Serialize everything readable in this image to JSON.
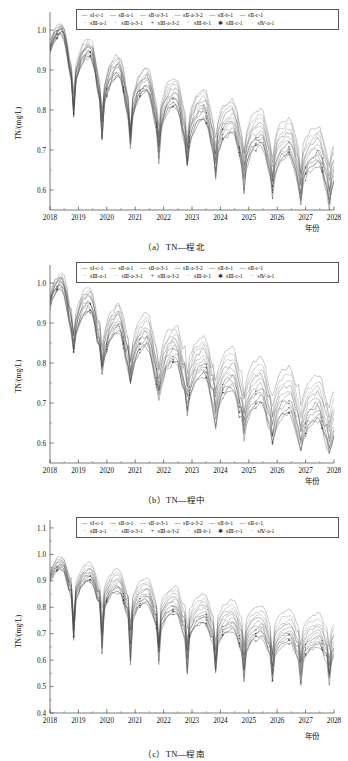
{
  "figure": {
    "title_implicit": "TN 浓度预测曲线",
    "axis_x_label": "年份",
    "axis_y_label": "TN/(mg/L)",
    "line_color": "#4a4a4a"
  },
  "legend": {
    "row1": [
      {
        "mark": "—",
        "label": "sⅠ-c-1"
      },
      {
        "mark": "",
        "label": "sⅡ-a-1"
      },
      {
        "mark": "",
        "label": "sⅡ-a-3-1"
      },
      {
        "mark": "",
        "label": "sⅡ-a-3-2"
      },
      {
        "mark": "",
        "label": "sⅡ-b-1"
      },
      {
        "mark": "",
        "label": "sⅡ-c-1"
      }
    ],
    "row2": [
      {
        "mark": "·",
        "label": "sⅢ-a-1"
      },
      {
        "mark": "·",
        "label": "sⅢ-a-3-1"
      },
      {
        "mark": "+",
        "label": "sⅢ-a-3-2"
      },
      {
        "mark": "·",
        "label": "sⅢ-b-1"
      },
      {
        "mark": "✱",
        "label": "sⅢ-c-1"
      },
      {
        "mark": "·",
        "label": "sⅣ-a-1"
      }
    ]
  },
  "panels": [
    {
      "id": "a",
      "caption": "（a）TN—程北",
      "y_ticks": [
        "1.0",
        "0.9",
        "0.8",
        "0.7",
        "0.6"
      ],
      "y_min": 0.55,
      "y_max": 1.045,
      "x_ticks": [
        "2018",
        "2019",
        "2020",
        "2021",
        "2022",
        "2023",
        "2024",
        "2025",
        "2026",
        "2027",
        "2028"
      ]
    },
    {
      "id": "b",
      "caption": "（b）TN—程中",
      "y_ticks": [
        "1.0",
        "0.9",
        "0.8",
        "0.7",
        "0.6"
      ],
      "y_min": 0.55,
      "y_max": 1.045,
      "x_ticks": [
        "2018",
        "2019",
        "2020",
        "2021",
        "2022",
        "2023",
        "2024",
        "2025",
        "2026",
        "2027",
        "2028"
      ]
    },
    {
      "id": "c",
      "caption": "（c）TN—程南",
      "y_ticks": [
        "1.1",
        "1.0",
        "0.9",
        "0.8",
        "0.7",
        "0.6",
        "0.5",
        "0.4"
      ],
      "y_min": 0.4,
      "y_max": 1.13,
      "x_ticks": [
        "2018",
        "2019",
        "2020",
        "2021",
        "2022",
        "2023",
        "2024",
        "2025",
        "2026",
        "2027",
        "2028"
      ]
    }
  ],
  "chart_data": {
    "type": "line",
    "xlabel": "年份",
    "ylabel": "TN/(mg/L)",
    "grid": false,
    "legend_position": "top-center-inside",
    "x": [
      2018,
      2019,
      2020,
      2021,
      2022,
      2023,
      2024,
      2025,
      2026,
      2027,
      2028
    ],
    "subplots": [
      {
        "id": "a",
        "caption": "（a）TN—程北",
        "ylim": [
          0.55,
          1.045
        ],
        "yticks": [
          0.6,
          0.7,
          0.8,
          0.9,
          1.0
        ],
        "xlim": [
          2018,
          2028
        ],
        "series": [
          {
            "name": "sⅠ-c-1",
            "values": [
              0.99,
              0.95,
              0.905,
              0.875,
              0.855,
              0.825,
              0.805,
              0.775,
              0.755,
              0.735,
              0.725
            ]
          },
          {
            "name": "sⅡ-a-1",
            "values": [
              0.985,
              0.945,
              0.9,
              0.87,
              0.845,
              0.815,
              0.795,
              0.765,
              0.745,
              0.722,
              0.712
            ]
          },
          {
            "name": "sⅡ-a-3-1",
            "values": [
              0.98,
              0.94,
              0.895,
              0.862,
              0.838,
              0.806,
              0.785,
              0.755,
              0.734,
              0.712,
              0.7
            ]
          },
          {
            "name": "sⅡ-a-3-2",
            "values": [
              0.978,
              0.936,
              0.89,
              0.856,
              0.83,
              0.798,
              0.776,
              0.746,
              0.724,
              0.702,
              0.69
            ]
          },
          {
            "name": "sⅡ-b-1",
            "values": [
              0.975,
              0.932,
              0.884,
              0.85,
              0.822,
              0.79,
              0.768,
              0.736,
              0.714,
              0.692,
              0.678
            ]
          },
          {
            "name": "sⅡ-c-1",
            "values": [
              0.972,
              0.928,
              0.878,
              0.844,
              0.815,
              0.782,
              0.758,
              0.726,
              0.704,
              0.68,
              0.668
            ]
          },
          {
            "name": "sⅢ-a-1",
            "values": [
              0.97,
              0.924,
              0.872,
              0.838,
              0.808,
              0.774,
              0.75,
              0.716,
              0.694,
              0.67,
              0.658
            ]
          },
          {
            "name": "sⅢ-a-3-1",
            "values": [
              0.968,
              0.92,
              0.868,
              0.832,
              0.802,
              0.766,
              0.742,
              0.708,
              0.685,
              0.66,
              0.648
            ]
          },
          {
            "name": "sⅢ-a-3-2",
            "values": [
              0.966,
              0.916,
              0.863,
              0.827,
              0.796,
              0.76,
              0.735,
              0.7,
              0.677,
              0.652,
              0.64
            ]
          },
          {
            "name": "sⅢ-c-1",
            "values": [
              0.964,
              0.913,
              0.859,
              0.822,
              0.79,
              0.754,
              0.728,
              0.693,
              0.67,
              0.645,
              0.632
            ]
          },
          {
            "name": "sⅣ-a-1",
            "values": [
              0.962,
              0.91,
              0.855,
              0.818,
              0.786,
              0.748,
              0.722,
              0.687,
              0.663,
              0.638,
              0.626
            ]
          }
        ]
      },
      {
        "id": "b",
        "caption": "（b）TN—程中",
        "ylim": [
          0.55,
          1.045
        ],
        "yticks": [
          0.6,
          0.7,
          0.8,
          0.9,
          1.0
        ],
        "xlim": [
          2018,
          2028
        ],
        "series": [
          {
            "name": "sⅠ-c-1",
            "values": [
              0.99,
              0.965,
              0.915,
              0.895,
              0.865,
              0.845,
              0.815,
              0.788,
              0.768,
              0.748,
              0.735
            ]
          },
          {
            "name": "sⅡ-a-1",
            "values": [
              0.985,
              0.958,
              0.905,
              0.884,
              0.852,
              0.83,
              0.8,
              0.772,
              0.75,
              0.73,
              0.716
            ]
          },
          {
            "name": "sⅡ-a-3-1",
            "values": [
              0.982,
              0.952,
              0.898,
              0.875,
              0.842,
              0.818,
              0.788,
              0.758,
              0.736,
              0.715,
              0.702
            ]
          },
          {
            "name": "sⅡ-a-3-2",
            "values": [
              0.979,
              0.946,
              0.891,
              0.866,
              0.833,
              0.807,
              0.777,
              0.746,
              0.723,
              0.702,
              0.69
            ]
          },
          {
            "name": "sⅡ-b-1",
            "values": [
              0.976,
              0.94,
              0.884,
              0.858,
              0.824,
              0.797,
              0.766,
              0.734,
              0.711,
              0.69,
              0.678
            ]
          },
          {
            "name": "sⅡ-c-1",
            "values": [
              0.973,
              0.934,
              0.877,
              0.85,
              0.815,
              0.787,
              0.755,
              0.723,
              0.7,
              0.678,
              0.666
            ]
          },
          {
            "name": "sⅢ-a-1",
            "values": [
              0.97,
              0.928,
              0.87,
              0.842,
              0.806,
              0.777,
              0.745,
              0.712,
              0.689,
              0.667,
              0.655
            ]
          },
          {
            "name": "sⅢ-a-3-1",
            "values": [
              0.967,
              0.922,
              0.864,
              0.835,
              0.798,
              0.768,
              0.735,
              0.702,
              0.679,
              0.656,
              0.645
            ]
          },
          {
            "name": "sⅢ-a-3-2",
            "values": [
              0.964,
              0.917,
              0.858,
              0.828,
              0.79,
              0.759,
              0.726,
              0.693,
              0.669,
              0.646,
              0.636
            ]
          },
          {
            "name": "sⅢ-c-1",
            "values": [
              0.961,
              0.912,
              0.853,
              0.822,
              0.783,
              0.751,
              0.718,
              0.684,
              0.66,
              0.637,
              0.628
            ]
          },
          {
            "name": "sⅣ-a-1",
            "values": [
              0.958,
              0.907,
              0.848,
              0.816,
              0.776,
              0.744,
              0.71,
              0.676,
              0.652,
              0.629,
              0.62
            ]
          }
        ]
      },
      {
        "id": "c",
        "caption": "（c）TN—程南",
        "ylim": [
          0.4,
          1.13
        ],
        "yticks": [
          0.4,
          0.5,
          0.6,
          0.7,
          0.8,
          0.9,
          1.0,
          1.1
        ],
        "xlim": [
          2018,
          2028
        ],
        "series": [
          {
            "name": "sⅠ-c-1",
            "values": [
              0.955,
              0.935,
              0.915,
              0.88,
              0.852,
              0.822,
              0.8,
              0.782,
              0.766,
              0.752,
              0.748
            ]
          },
          {
            "name": "sⅡ-a-1",
            "values": [
              0.95,
              0.925,
              0.902,
              0.866,
              0.838,
              0.806,
              0.783,
              0.763,
              0.745,
              0.73,
              0.726
            ]
          },
          {
            "name": "sⅡ-a-3-1",
            "values": [
              0.946,
              0.917,
              0.892,
              0.855,
              0.826,
              0.793,
              0.769,
              0.748,
              0.729,
              0.714,
              0.71
            ]
          },
          {
            "name": "sⅡ-a-3-2",
            "values": [
              0.942,
              0.91,
              0.883,
              0.845,
              0.815,
              0.781,
              0.757,
              0.735,
              0.716,
              0.7,
              0.696
            ]
          },
          {
            "name": "sⅡ-b-1",
            "values": [
              0.938,
              0.903,
              0.874,
              0.836,
              0.805,
              0.77,
              0.745,
              0.723,
              0.703,
              0.687,
              0.684
            ]
          },
          {
            "name": "sⅡ-c-1",
            "values": [
              0.934,
              0.897,
              0.866,
              0.827,
              0.795,
              0.76,
              0.734,
              0.711,
              0.691,
              0.675,
              0.672
            ]
          },
          {
            "name": "sⅢ-a-1",
            "values": [
              0.93,
              0.891,
              0.858,
              0.819,
              0.786,
              0.75,
              0.724,
              0.7,
              0.68,
              0.664,
              0.661
            ]
          },
          {
            "name": "sⅢ-a-3-1",
            "values": [
              0.926,
              0.885,
              0.851,
              0.811,
              0.777,
              0.741,
              0.714,
              0.69,
              0.669,
              0.653,
              0.65
            ]
          },
          {
            "name": "sⅢ-a-3-2",
            "values": [
              0.922,
              0.879,
              0.844,
              0.803,
              0.769,
              0.732,
              0.705,
              0.68,
              0.659,
              0.643,
              0.64
            ]
          },
          {
            "name": "sⅢ-c-1",
            "values": [
              0.918,
              0.874,
              0.838,
              0.796,
              0.761,
              0.724,
              0.696,
              0.671,
              0.65,
              0.634,
              0.631
            ]
          },
          {
            "name": "sⅣ-a-1",
            "values": [
              0.914,
              0.869,
              0.832,
              0.789,
              0.753,
              0.716,
              0.688,
              0.662,
              0.641,
              0.625,
              0.622
            ]
          }
        ]
      }
    ]
  }
}
